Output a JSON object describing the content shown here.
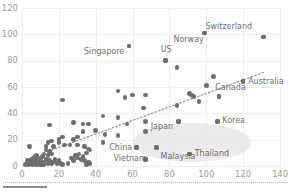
{
  "chart_data": {
    "type": "scatter",
    "title": "",
    "subtitle": "",
    "xlabel": "",
    "ylabel": "",
    "xlim": [
      0,
      140
    ],
    "ylim": [
      0,
      120
    ],
    "xticks": [
      0,
      20,
      40,
      60,
      80,
      100,
      120,
      140
    ],
    "yticks": [
      0,
      20,
      40,
      60,
      80,
      100,
      120
    ],
    "grid": true,
    "legend": "none",
    "marker_color": "#6e6e6e",
    "gridline_color": "#ededed",
    "tick_label_color": "#9a9a9a",
    "data_label_color": "#6d6d6d",
    "highlight_region": {
      "shape": "ellipse",
      "color": "#e4e4e4",
      "center_x": 92,
      "center_y": 18,
      "radius_x": 32,
      "radius_y": 15
    },
    "trendline": {
      "style": "dotted",
      "color": "#8e8e8e",
      "x_start": 16,
      "y_start": 12,
      "x_end": 131,
      "y_end": 71
    },
    "labeled_points": [
      {
        "label": "Switzerland",
        "x": 131,
        "y": 98,
        "label_dx": -58,
        "label_dy": -11
      },
      {
        "label": "Norway",
        "x": 99,
        "y": 101,
        "label_dx": -31,
        "label_dy": 6
      },
      {
        "label": "US",
        "x": 78,
        "y": 80,
        "label_dx": -5,
        "label_dy": -12
      },
      {
        "label": "Singapore",
        "x": 58,
        "y": 91,
        "label_dx": -45,
        "label_dy": 5
      },
      {
        "label": "Australia",
        "x": 120,
        "y": 64,
        "label_dx": 5,
        "label_dy": -1
      },
      {
        "label": "Canada",
        "x": 107,
        "y": 53,
        "label_dx": -4,
        "label_dy": -9
      },
      {
        "label": "Korea",
        "x": 106,
        "y": 34,
        "label_dx": 5,
        "label_dy": -1
      },
      {
        "label": "Japan",
        "x": 85,
        "y": 34,
        "label_dx": -28,
        "label_dy": 5
      },
      {
        "label": "Malaysia",
        "x": 73,
        "y": 14,
        "label_dx": 4,
        "label_dy": 8
      },
      {
        "label": "Thailand",
        "x": 91,
        "y": 9,
        "label_dx": 5,
        "label_dy": -1
      },
      {
        "label": "China",
        "x": 62,
        "y": 14,
        "label_dx": -27,
        "label_dy": -1
      },
      {
        "label": "Vietnam",
        "x": 67,
        "y": 5,
        "label_dx": -32,
        "label_dy": -1
      }
    ],
    "points": [
      {
        "x": 131,
        "y": 98
      },
      {
        "x": 99,
        "y": 101
      },
      {
        "x": 78,
        "y": 80
      },
      {
        "x": 58,
        "y": 91
      },
      {
        "x": 84,
        "y": 75
      },
      {
        "x": 120,
        "y": 64
      },
      {
        "x": 104,
        "y": 68
      },
      {
        "x": 100,
        "y": 61
      },
      {
        "x": 107,
        "y": 53
      },
      {
        "x": 106,
        "y": 34
      },
      {
        "x": 85,
        "y": 34
      },
      {
        "x": 73,
        "y": 14
      },
      {
        "x": 91,
        "y": 9
      },
      {
        "x": 62,
        "y": 14
      },
      {
        "x": 67,
        "y": 5
      },
      {
        "x": 92,
        "y": 54
      },
      {
        "x": 93,
        "y": 53
      },
      {
        "x": 91,
        "y": 55
      },
      {
        "x": 96,
        "y": 49
      },
      {
        "x": 84,
        "y": 46
      },
      {
        "x": 67,
        "y": 54
      },
      {
        "x": 60,
        "y": 54
      },
      {
        "x": 52,
        "y": 57
      },
      {
        "x": 56,
        "y": 52
      },
      {
        "x": 66,
        "y": 44
      },
      {
        "x": 22,
        "y": 50
      },
      {
        "x": 44,
        "y": 38
      },
      {
        "x": 52,
        "y": 37
      },
      {
        "x": 67,
        "y": 34
      },
      {
        "x": 57,
        "y": 32
      },
      {
        "x": 36,
        "y": 32
      },
      {
        "x": 33,
        "y": 32
      },
      {
        "x": 28,
        "y": 33
      },
      {
        "x": 15,
        "y": 31
      },
      {
        "x": 67,
        "y": 26
      },
      {
        "x": 45,
        "y": 24
      },
      {
        "x": 52,
        "y": 23
      },
      {
        "x": 40,
        "y": 27
      },
      {
        "x": 33,
        "y": 26
      },
      {
        "x": 30,
        "y": 22
      },
      {
        "x": 28,
        "y": 20
      },
      {
        "x": 22,
        "y": 22
      },
      {
        "x": 20,
        "y": 20
      },
      {
        "x": 20,
        "y": 18
      },
      {
        "x": 16,
        "y": 19
      },
      {
        "x": 14,
        "y": 18
      },
      {
        "x": 13,
        "y": 15
      },
      {
        "x": 17,
        "y": 15
      },
      {
        "x": 23,
        "y": 16
      },
      {
        "x": 26,
        "y": 16
      },
      {
        "x": 30,
        "y": 16
      },
      {
        "x": 34,
        "y": 15
      },
      {
        "x": 4,
        "y": 15
      },
      {
        "x": 36,
        "y": 13
      },
      {
        "x": 37,
        "y": 12
      },
      {
        "x": 44,
        "y": 18
      },
      {
        "x": 13,
        "y": 12
      },
      {
        "x": 15,
        "y": 11
      },
      {
        "x": 16,
        "y": 9
      },
      {
        "x": 14,
        "y": 8
      },
      {
        "x": 12,
        "y": 9
      },
      {
        "x": 11,
        "y": 7
      },
      {
        "x": 13,
        "y": 5
      },
      {
        "x": 15,
        "y": 4
      },
      {
        "x": 17,
        "y": 3
      },
      {
        "x": 16,
        "y": 2
      },
      {
        "x": 14,
        "y": 2
      },
      {
        "x": 12,
        "y": 3
      },
      {
        "x": 10,
        "y": 4
      },
      {
        "x": 9,
        "y": 2
      },
      {
        "x": 8,
        "y": 3
      },
      {
        "x": 7,
        "y": 5
      },
      {
        "x": 6,
        "y": 3
      },
      {
        "x": 5,
        "y": 2
      },
      {
        "x": 4,
        "y": 3
      },
      {
        "x": 3,
        "y": 2
      },
      {
        "x": 5,
        "y": 5
      },
      {
        "x": 6,
        "y": 6
      },
      {
        "x": 7,
        "y": 7
      },
      {
        "x": 8,
        "y": 8
      },
      {
        "x": 9,
        "y": 6
      },
      {
        "x": 10,
        "y": 1
      },
      {
        "x": 11,
        "y": 1
      },
      {
        "x": 8,
        "y": 1
      },
      {
        "x": 6,
        "y": 1
      },
      {
        "x": 4,
        "y": 1
      },
      {
        "x": 3,
        "y": 4
      },
      {
        "x": 29,
        "y": 8
      },
      {
        "x": 30,
        "y": 6
      },
      {
        "x": 31,
        "y": 9
      },
      {
        "x": 32,
        "y": 5
      },
      {
        "x": 33,
        "y": 7
      },
      {
        "x": 34,
        "y": 4
      },
      {
        "x": 35,
        "y": 10
      },
      {
        "x": 36,
        "y": 3
      },
      {
        "x": 37,
        "y": 2
      },
      {
        "x": 35,
        "y": 1
      },
      {
        "x": 28,
        "y": 4
      },
      {
        "x": 27,
        "y": 6
      },
      {
        "x": 19,
        "y": 2
      },
      {
        "x": 20,
        "y": 4
      },
      {
        "x": 21,
        "y": 2
      },
      {
        "x": 18,
        "y": 5
      },
      {
        "x": 22,
        "y": 1
      },
      {
        "x": 25,
        "y": 2
      },
      {
        "x": 2,
        "y": 1
      },
      {
        "x": 12,
        "y": 1
      }
    ]
  }
}
